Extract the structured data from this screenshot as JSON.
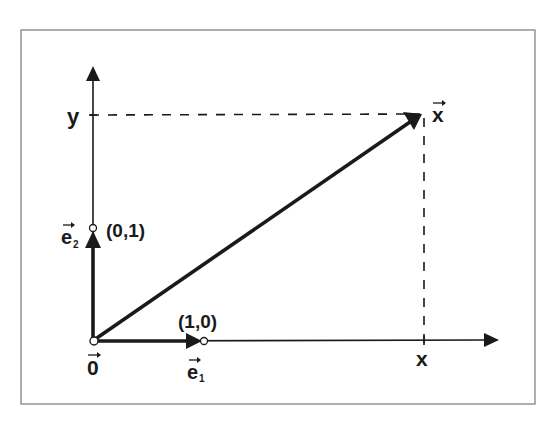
{
  "diagram": {
    "type": "vector-coordinate-diagram",
    "axes": {
      "x_axis_label": "x",
      "y_axis_label": "y"
    },
    "origin": {
      "label": "0",
      "vector_arrow": true
    },
    "basis_vectors": [
      {
        "name": "e",
        "subscript": "1",
        "endpoint_label": "(1,0)"
      },
      {
        "name": "e",
        "subscript": "2",
        "endpoint_label": "(0,1)"
      }
    ],
    "main_vector": {
      "label": "x",
      "vector_arrow": true
    },
    "projection_lines": {
      "style": "dashed",
      "to_x": "x",
      "to_y": "y"
    },
    "colors": {
      "stroke": "#1a1a1a",
      "frame": "#7a7a7a",
      "background": "#ffffff"
    }
  }
}
